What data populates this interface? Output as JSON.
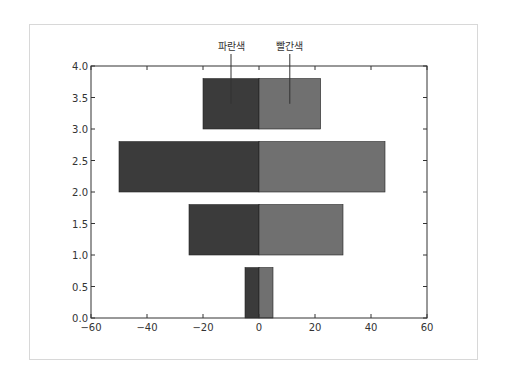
{
  "chart_data": {
    "type": "bar",
    "orientation": "horizontal",
    "title": "",
    "xlabel": "",
    "ylabel": "",
    "xlim": [
      -60,
      60
    ],
    "ylim": [
      0.0,
      4.0
    ],
    "xticks": [
      "−60",
      "−40",
      "−20",
      "0",
      "20",
      "40",
      "60"
    ],
    "yticks": [
      "0.0",
      "0.5",
      "1.0",
      "1.5",
      "2.0",
      "2.5",
      "3.0",
      "3.5",
      "4.0"
    ],
    "grid": false,
    "bar_height": 0.8,
    "bar_bottoms": [
      0,
      1,
      2,
      3
    ],
    "series": [
      {
        "name": "파란색",
        "color": "#3b3b3b",
        "values": [
          -5,
          -25,
          -50,
          -20
        ]
      },
      {
        "name": "빨간색",
        "color": "#707070",
        "values": [
          5,
          30,
          45,
          22
        ]
      }
    ],
    "annotations": [
      {
        "text": "파란색",
        "points_to_series": 0
      },
      {
        "text": "빨간색",
        "points_to_series": 1
      }
    ]
  }
}
